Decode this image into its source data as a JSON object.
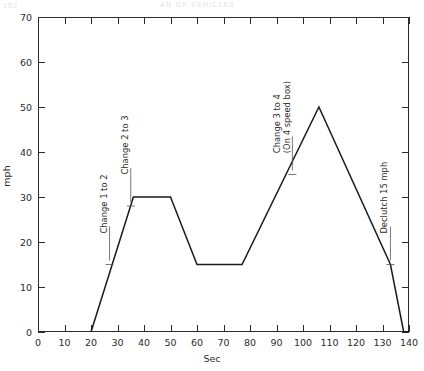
{
  "scan_header": {
    "left": "102",
    "middle": "AN  OF  VEHICLES"
  },
  "chart_data": {
    "type": "line",
    "title": "",
    "xlabel": "Sec",
    "ylabel": "mph",
    "xlim": [
      0,
      140
    ],
    "ylim": [
      0,
      70
    ],
    "xticks": [
      0,
      10,
      20,
      30,
      40,
      50,
      60,
      70,
      80,
      90,
      100,
      110,
      120,
      130,
      140
    ],
    "yticks": [
      0,
      10,
      20,
      30,
      40,
      50,
      60,
      70
    ],
    "xtick_labels": [
      "0",
      "10",
      "20",
      "30",
      "40",
      "50",
      "60",
      "70",
      "80",
      "90",
      "100",
      "110",
      "120",
      "130",
      "140"
    ],
    "ytick_labels": [
      "0",
      "10",
      "20",
      "30",
      "40",
      "50",
      "60",
      "70"
    ],
    "grid": false,
    "legend": "none",
    "series": [
      {
        "name": "Vehicle speed",
        "color": "#1a1a1a",
        "x": [
          20,
          36,
          50,
          60,
          77,
          106,
          133,
          138,
          140
        ],
        "y": [
          0,
          30,
          30,
          15,
          15,
          50,
          15,
          0,
          0
        ]
      }
    ],
    "annotations": [
      {
        "id": "change-1-to-2",
        "text_lines": [
          "Change 1 to 2"
        ],
        "x": 27,
        "y": 15,
        "rotation": -90
      },
      {
        "id": "change-2-to-3",
        "text_lines": [
          "Change 2 to 3"
        ],
        "x": 35,
        "y": 28,
        "rotation": -90
      },
      {
        "id": "change-3-to-4",
        "text_lines": [
          "Change 3 to 4",
          "(On 4 speed box)"
        ],
        "x": 96,
        "y": 35,
        "rotation": -90
      },
      {
        "id": "declutch-15-mph",
        "text_lines": [
          "Declutch 15 mph"
        ],
        "x": 133,
        "y": 15,
        "rotation": -90
      }
    ]
  }
}
